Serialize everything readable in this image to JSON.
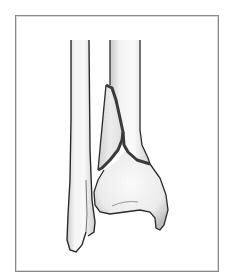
{
  "figure": {
    "caption": "Illustration of a distal tibia fracture with the fibula alongside",
    "structures": [
      {
        "id": "fibula",
        "label": "Fibula"
      },
      {
        "id": "tibia",
        "label": "Tibia"
      },
      {
        "id": "fracture-line",
        "label": "Fracture line"
      },
      {
        "id": "fragment",
        "label": "Displaced bone fragment"
      }
    ]
  },
  "style": {
    "frame_color": "#8a8a8a",
    "outline_color": "#2a2a2a",
    "fracture_color": "#3a3a3a",
    "bone_fill": "#f3f3f3",
    "shade_color": "#9a9a9a"
  }
}
